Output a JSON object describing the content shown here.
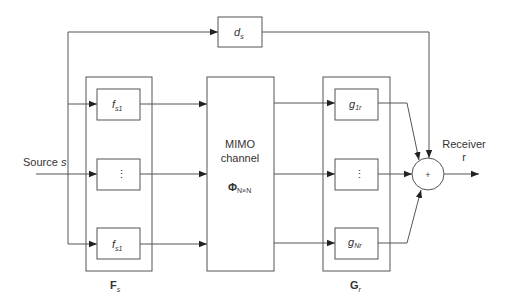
{
  "diagram": {
    "type": "block-diagram",
    "colors": {
      "stroke": "#555555",
      "text": "#333333",
      "background": "#ffffff"
    },
    "source": {
      "label": "Source",
      "symbol": "s"
    },
    "delay_block": {
      "symbol": "d",
      "subscript": "s"
    },
    "precoder_group": {
      "label": "F",
      "subscript": "s",
      "blocks": [
        {
          "symbol": "f",
          "subscript": "s1"
        },
        {
          "symbol": "⋮",
          "subscript": ""
        },
        {
          "symbol": "f",
          "subscript": "s1"
        }
      ]
    },
    "channel": {
      "line1": "MIMO",
      "line2": "channel",
      "symbol": "Φ",
      "subscript": "N×N"
    },
    "combiner_group": {
      "label": "G",
      "subscript": "r",
      "blocks": [
        {
          "symbol": "g",
          "subscript": "1r"
        },
        {
          "symbol": "⋮",
          "subscript": ""
        },
        {
          "symbol": "g",
          "subscript": "Nr"
        }
      ]
    },
    "summer": {
      "symbol": "+"
    },
    "receiver": {
      "label": "Receiver",
      "symbol": "r"
    }
  }
}
